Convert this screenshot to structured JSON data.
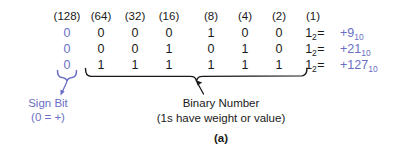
{
  "figure": {
    "label": "(a)",
    "accent_color": "#6a6fc4",
    "text_color": "#1a1a1a",
    "background_color": "#ffffff"
  },
  "weights": {
    "sign": "(128)",
    "magnitude": [
      "(64)",
      "(32)",
      "(16)",
      "(8)",
      "(4)",
      "(2)",
      "(1)"
    ]
  },
  "rows": [
    {
      "sign_bit": "0",
      "bits": [
        "0",
        "0",
        "0",
        "1",
        "0",
        "0",
        "1"
      ],
      "base_subscript": "2",
      "equals": "=",
      "decimal_sign": "+",
      "decimal_value": "9",
      "decimal_subscript": "10"
    },
    {
      "sign_bit": "0",
      "bits": [
        "0",
        "0",
        "1",
        "0",
        "1",
        "0",
        "1"
      ],
      "base_subscript": "2",
      "equals": "=",
      "decimal_sign": "+",
      "decimal_value": "21",
      "decimal_subscript": "10"
    },
    {
      "sign_bit": "0",
      "bits": [
        "1",
        "1",
        "1",
        "1",
        "1",
        "1",
        "1"
      ],
      "base_subscript": "2",
      "equals": "=",
      "decimal_sign": "+",
      "decimal_value": "127",
      "decimal_subscript": "10"
    }
  ],
  "annotations": {
    "sign_bit": {
      "title": "Sign Bit",
      "detail": "(0 = +)"
    },
    "binary_number": {
      "title": "Binary Number",
      "detail": "(1s have weight or value)"
    }
  },
  "icons": {
    "sign_brace": "curly-brace-small-icon",
    "binary_brace": "curly-brace-large-icon",
    "sign_arrow": "arrow-pointer-icon",
    "binary_arrow": "arrow-pointer-icon"
  }
}
